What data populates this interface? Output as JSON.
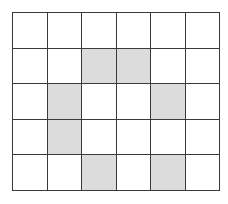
{
  "grid": {
    "rows": 5,
    "cols": 6,
    "colors": {
      "shaded": "#dcdcdc",
      "empty": "#ffffff",
      "line": "#3a3a3a"
    },
    "shaded_cells": [
      {
        "row": 1,
        "col": 2
      },
      {
        "row": 1,
        "col": 3
      },
      {
        "row": 2,
        "col": 1
      },
      {
        "row": 2,
        "col": 4
      },
      {
        "row": 3,
        "col": 1
      },
      {
        "row": 4,
        "col": 2
      },
      {
        "row": 4,
        "col": 4
      }
    ]
  }
}
